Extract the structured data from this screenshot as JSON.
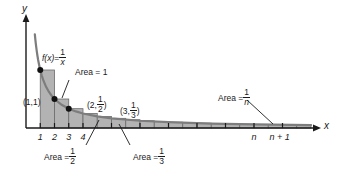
{
  "chart_data": {
    "type": "area",
    "title": "",
    "xlabel": "x",
    "ylabel": "y",
    "function_label": {
      "lhs": "f(x)",
      "eq": "=",
      "num": "1",
      "den": "x"
    },
    "xlim": [
      0,
      20.5
    ],
    "ylim": [
      0,
      1.55
    ],
    "grid": false,
    "legend": "none",
    "curve": {
      "name": "f(x) = 1/x",
      "color": "#7d7d7d",
      "x": [
        0.62,
        0.66,
        0.7,
        0.75,
        0.8,
        0.85,
        0.9,
        0.95,
        1.0,
        1.1,
        1.2,
        1.4,
        1.6,
        1.8,
        2.0,
        2.5,
        3.0,
        3.5,
        4.0,
        5.0,
        6.0,
        8.0,
        10.0,
        13.0,
        16.0,
        20.0
      ],
      "y": [
        1.613,
        1.515,
        1.429,
        1.333,
        1.25,
        1.176,
        1.111,
        1.053,
        1.0,
        0.909,
        0.833,
        0.714,
        0.625,
        0.556,
        0.5,
        0.4,
        0.333,
        0.286,
        0.25,
        0.2,
        0.167,
        0.125,
        0.1,
        0.077,
        0.0625,
        0.05
      ]
    },
    "rectangles": [
      {
        "x0": 1,
        "x1": 2,
        "height": 1.0,
        "area": "1"
      },
      {
        "x0": 2,
        "x1": 3,
        "height": 0.5,
        "area": "1/2"
      },
      {
        "x0": 3,
        "x1": 4,
        "height": 0.3333,
        "area": "1/3"
      },
      {
        "x0": 4,
        "x1": 5,
        "height": 0.25,
        "area": "1/4"
      },
      {
        "x0": 5,
        "x1": 6,
        "height": 0.2,
        "area": "1/5"
      },
      {
        "x0": 6,
        "x1": 7,
        "height": 0.1667,
        "area": "1/6"
      },
      {
        "x0": 7,
        "x1": 8,
        "height": 0.1429,
        "area": "1/7"
      },
      {
        "x0": 8,
        "x1": 9,
        "height": 0.125,
        "area": "1/8"
      },
      {
        "x0": 9,
        "x1": 10,
        "height": 0.1111,
        "area": "1/9"
      },
      {
        "x0": 10,
        "x1": 11,
        "height": 0.1,
        "area": "1/10"
      },
      {
        "x0": 11,
        "x1": 12,
        "height": 0.0909,
        "area": "1/11"
      },
      {
        "x0": 12,
        "x1": 13,
        "height": 0.0833,
        "area": "1/12"
      },
      {
        "x0": 13,
        "x1": 14,
        "height": 0.0769,
        "area": "1/13"
      },
      {
        "x0": 14,
        "x1": 15,
        "height": 0.0714,
        "area": "1/14"
      },
      {
        "x0": 15,
        "x1": 16,
        "height": 0.0667,
        "area": "1/15"
      },
      {
        "x0": 16,
        "x1": 17,
        "height": 0.0625,
        "area": "1/16"
      },
      {
        "x0": 17,
        "x1": 18,
        "height": 0.0588,
        "area": "1/17"
      },
      {
        "x0": 18,
        "x1": 19,
        "height": 0.0556,
        "area": "1/18"
      },
      {
        "x0": 19,
        "x1": 20,
        "height": 0.0526,
        "area": "1/19"
      }
    ],
    "points": [
      {
        "x": 1,
        "y": 1.0,
        "label": "(1,1)"
      },
      {
        "x": 2,
        "y": 0.5,
        "label": "(2, 1/2)"
      },
      {
        "x": 3,
        "y": 0.3333,
        "label": "(3, 1/3)"
      }
    ],
    "xticks": [
      {
        "x": 1,
        "label": "1"
      },
      {
        "x": 2,
        "label": "2"
      },
      {
        "x": 3,
        "label": "3"
      },
      {
        "x": 4,
        "label": "4"
      },
      {
        "x": 6,
        "label": ""
      },
      {
        "x": 8,
        "label": ""
      },
      {
        "x": 10,
        "label": ""
      },
      {
        "x": 12,
        "label": ""
      },
      {
        "x": 14,
        "label": ""
      },
      {
        "x": 16,
        "label": "n"
      },
      {
        "x": 18,
        "label": "n + 1"
      }
    ],
    "fill_color": "#b3b3b3",
    "axis_color": "#1a1a1a"
  },
  "axes": {
    "y_label": "y",
    "x_label": "x"
  },
  "function_label": {
    "prefix": "f(x)",
    "equals": "=",
    "numerator": "1",
    "denominator": "x"
  },
  "points": {
    "p1": "(1,1)",
    "p2_open": "(2,",
    "p2_num": "1",
    "p2_den": "2",
    "p2_close": ")",
    "p3_open": "(3,",
    "p3_num": "1",
    "p3_den": "3",
    "p3_close": ")"
  },
  "annotations": {
    "area1": "Area = 1",
    "area_half_prefix": "Area =",
    "area_half_num": "1",
    "area_half_den": "2",
    "area_third_prefix": "Area =",
    "area_third_num": "1",
    "area_third_den": "3",
    "area_n_prefix": "Area =",
    "area_n_num": "1",
    "area_n_den": "n"
  },
  "ticks": {
    "t1": "1",
    "t2": "2",
    "t3": "3",
    "t4": "4",
    "tn": "n",
    "tn1": "n + 1"
  }
}
